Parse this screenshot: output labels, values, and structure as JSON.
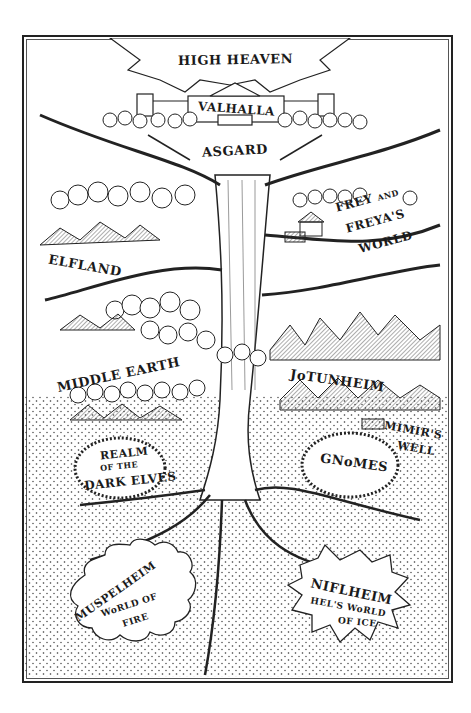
{
  "map": {
    "title": "Yggdrasil - The Nine Worlds",
    "regions": {
      "high_heaven": "HIGH HEAVEN",
      "valhalla": "VALHALLA",
      "asgard": "ASGARD",
      "frey_a": "FREY",
      "frey_and": "AND",
      "frey_b": "FREYA'S",
      "frey_c": "WORLD",
      "elfland": "ELFLAND",
      "middle_earth": "MIDDLE EARTH",
      "jotunheim": "JoTUNHEIM",
      "mimirs_well_a": "MIMIR'S",
      "mimirs_well_b": "WELL",
      "dark_elves_a": "REALM",
      "dark_elves_b": "OF THE",
      "dark_elves_c": "DARK ELVES",
      "gnomes": "GNoMES",
      "muspelheim_a": "MUSPELHEIM",
      "muspelheim_b": "WoRLD OF",
      "muspelheim_c": "FIRE",
      "niflheim_a": "NIFLHEIM",
      "niflheim_b": "HEL'S WoRLD",
      "niflheim_c": "OF ICE"
    },
    "colors": {
      "ink": "#1a1a1a",
      "paper": "#ffffff",
      "stipple": "#333333"
    }
  }
}
